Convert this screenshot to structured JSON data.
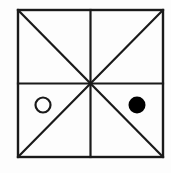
{
  "figure": {
    "canvas": {
      "width": 171,
      "height": 173,
      "background": "#fdfdfd"
    },
    "stroke_color": "#1a1a1a",
    "fill_color": "#000000",
    "square": {
      "label": "outer square",
      "x": 18,
      "y": 10,
      "width": 145,
      "height": 147,
      "stroke_width": 2.4
    },
    "center": {
      "x": 90.5,
      "y": 83.5
    },
    "lines": [
      {
        "name": "vertical-midline",
        "x1": 90.5,
        "y1": 10,
        "x2": 90.5,
        "y2": 157,
        "stroke_width": 2.2
      },
      {
        "name": "horizontal-midline",
        "x1": 18,
        "y1": 83.5,
        "x2": 163,
        "y2": 83.5,
        "stroke_width": 2.2
      },
      {
        "name": "diagonal-top-left-to-bottom-right",
        "x1": 18,
        "y1": 10,
        "x2": 163,
        "y2": 157,
        "stroke_width": 2.2
      },
      {
        "name": "diagonal-top-right-to-bottom-left",
        "x1": 163,
        "y1": 10,
        "x2": 18,
        "y2": 157,
        "stroke_width": 2.2
      }
    ],
    "markers": [
      {
        "name": "hollow-circle-marker",
        "style": "open",
        "quadrant": "bottom-left",
        "cx": 43,
        "cy": 105,
        "r": 7.5,
        "fill": "#ffffff",
        "stroke": "#1a1a1a",
        "stroke_width": 2.2
      },
      {
        "name": "filled-circle-marker",
        "style": "filled",
        "quadrant": "bottom-right",
        "cx": 137,
        "cy": 105,
        "r": 8.5,
        "fill": "#000000",
        "stroke": "#000000",
        "stroke_width": 0
      }
    ]
  }
}
